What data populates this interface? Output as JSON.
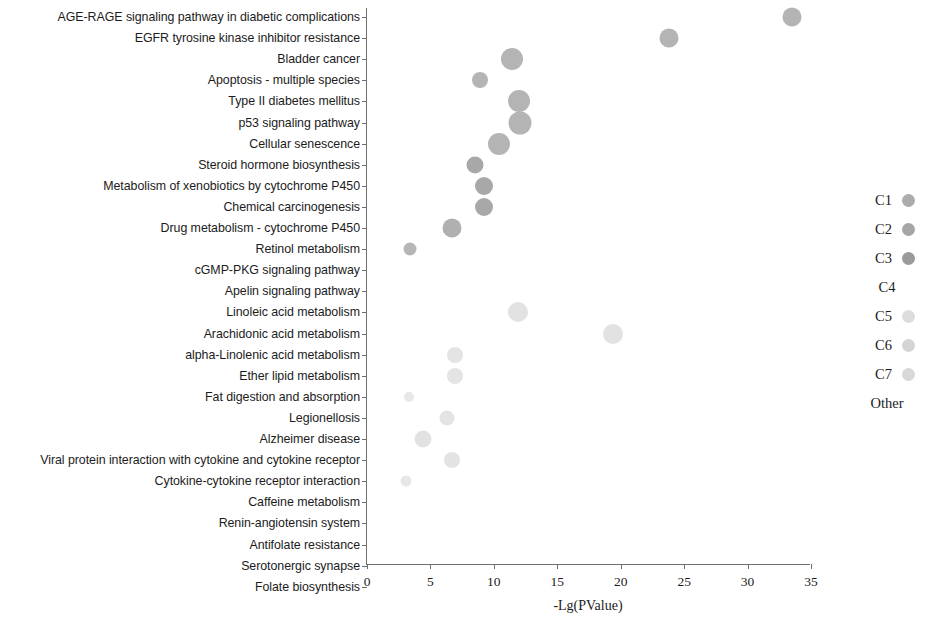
{
  "chart_data": {
    "type": "scatter",
    "title": "",
    "xlabel": "-Lg(PValue)",
    "ylabel": "",
    "xlim": [
      0,
      35
    ],
    "xticks": [
      0,
      5,
      10,
      15,
      20,
      25,
      30,
      35
    ],
    "xtick_labels": [
      "0",
      "5",
      "10",
      "15",
      "20",
      "25",
      "30",
      "35"
    ],
    "grid": false,
    "legend_position": "right",
    "categories": [
      "AGE-RAGE signaling pathway in diabetic complications",
      "EGFR tyrosine kinase inhibitor resistance",
      "Bladder cancer",
      "Apoptosis - multiple species",
      "Type II diabetes mellitus",
      "p53 signaling pathway",
      "Cellular senescence",
      "Steroid hormone biosynthesis",
      "Metabolism of xenobiotics by cytochrome P450",
      "Chemical carcinogenesis",
      "Drug metabolism - cytochrome P450",
      "Retinol metabolism",
      "cGMP-PKG signaling pathway",
      "Apelin signaling pathway",
      "Linoleic acid metabolism",
      "Arachidonic acid metabolism",
      "alpha-Linolenic acid metabolism",
      "Ether lipid metabolism",
      "Fat digestion and absorption",
      "Legionellosis",
      "Alzheimer disease",
      "Viral protein interaction with cytokine and cytokine receptor",
      "Cytokine-cytokine receptor interaction",
      "Caffeine metabolism",
      "Renin-angiotensin system",
      "Antifolate resistance",
      "Serotonergic synapse",
      "Folate biosynthesis"
    ],
    "points": [
      {
        "category": "AGE-RAGE signaling pathway in diabetic complications",
        "row": 0,
        "x": 33.5,
        "size": 19,
        "color": "#b4b4b4"
      },
      {
        "category": "EGFR tyrosine kinase inhibitor resistance",
        "row": 1,
        "x": 23.8,
        "size": 19,
        "color": "#b4b4b4"
      },
      {
        "category": "Bladder cancer",
        "row": 2,
        "x": 11.4,
        "size": 22,
        "color": "#b4b4b4"
      },
      {
        "category": "Apoptosis - multiple species",
        "row": 3,
        "x": 8.9,
        "size": 16,
        "color": "#b4b4b4"
      },
      {
        "category": "Type II diabetes mellitus",
        "row": 4,
        "x": 12.0,
        "size": 22,
        "color": "#b4b4b4"
      },
      {
        "category": "p53 signaling pathway",
        "row": 5,
        "x": 12.1,
        "size": 23,
        "color": "#b4b4b4"
      },
      {
        "category": "Cellular senescence",
        "row": 6,
        "x": 10.4,
        "size": 22,
        "color": "#b4b4b4"
      },
      {
        "category": "Steroid hormone biosynthesis",
        "row": 7,
        "x": 8.5,
        "size": 17,
        "color": "#a8a8a8"
      },
      {
        "category": "Metabolism of xenobiotics by cytochrome P450",
        "row": 8,
        "x": 9.2,
        "size": 18,
        "color": "#a8a8a8"
      },
      {
        "category": "Chemical carcinogenesis",
        "row": 9,
        "x": 9.2,
        "size": 18,
        "color": "#a8a8a8"
      },
      {
        "category": "Drug metabolism - cytochrome P450",
        "row": 10,
        "x": 6.7,
        "size": 19,
        "color": "#b0b0b0"
      },
      {
        "category": "Retinol metabolism",
        "row": 11,
        "x": 3.4,
        "size": 13,
        "color": "#b6b6b6"
      },
      {
        "category": "Linoleic acid metabolism",
        "row": 14,
        "x": 11.9,
        "size": 20,
        "color": "#e2e2e2"
      },
      {
        "category": "Arachidonic acid metabolism",
        "row": 15,
        "x": 19.4,
        "size": 20,
        "color": "#e2e2e2"
      },
      {
        "category": "alpha-Linolenic acid metabolism",
        "row": 16,
        "x": 6.9,
        "size": 16,
        "color": "#e4e4e4"
      },
      {
        "category": "Ether lipid metabolism",
        "row": 17,
        "x": 6.9,
        "size": 16,
        "color": "#e4e4e4"
      },
      {
        "category": "Fat digestion and absorption",
        "row": 18,
        "x": 3.3,
        "size": 10,
        "color": "#e8e8e8"
      },
      {
        "category": "Legionellosis",
        "row": 19,
        "x": 6.3,
        "size": 15,
        "color": "#e4e4e4"
      },
      {
        "category": "Alzheimer disease",
        "row": 20,
        "x": 4.4,
        "size": 17,
        "color": "#e2e2e2"
      },
      {
        "category": "Viral protein interaction with cytokine and cytokine receptor",
        "row": 21,
        "x": 6.7,
        "size": 16,
        "color": "#e3e3e3"
      },
      {
        "category": "Cytokine-cytokine receptor interaction",
        "row": 22,
        "x": 3.1,
        "size": 11,
        "color": "#e7e7e7"
      }
    ],
    "legend": [
      {
        "label": "C1",
        "color": "#acacac",
        "has_swatch": true
      },
      {
        "label": "C2",
        "color": "#a6a6a6",
        "has_swatch": true
      },
      {
        "label": "C3",
        "color": "#9a9a9a",
        "has_swatch": true
      },
      {
        "label": "C4",
        "color": "#ffffff",
        "has_swatch": false
      },
      {
        "label": "C5",
        "color": "#dcdcdc",
        "has_swatch": true
      },
      {
        "label": "C6",
        "color": "#d4d4d4",
        "has_swatch": true
      },
      {
        "label": "C7",
        "color": "#d8d8d8",
        "has_swatch": true
      },
      {
        "label": "Other",
        "color": "#ffffff",
        "has_swatch": false
      }
    ]
  },
  "axis": {
    "x_title": "-Lg(PValue)"
  }
}
